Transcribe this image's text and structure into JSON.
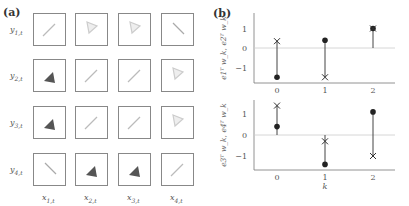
{
  "panel_a": {
    "label": "(a)",
    "row_labels": [
      "y1,t",
      "y2,t",
      "y3,t",
      "y4,t"
    ],
    "col_labels": [
      "x1,t",
      "x2,t",
      "x3,t",
      "x4,t"
    ],
    "grid": [
      [
        "line-ne-light",
        "triangle-outline-light",
        "triangle-outline-light",
        "line-nw-light"
      ],
      [
        "triangle-dark",
        "line-ne-light",
        "line-ne-light",
        "triangle-outline-light"
      ],
      [
        "triangle-dark",
        "line-ne-light",
        "line-ne-light",
        "triangle-outline-light"
      ],
      [
        "line-nw-light",
        "triangle-dark",
        "triangle-dark",
        "line-ne-light"
      ]
    ]
  },
  "panel_b": {
    "label": "(b)"
  },
  "chart_data": [
    {
      "type": "scatter",
      "subtype": "stem",
      "title": "",
      "xlabel": "",
      "ylabel": "e1ᵀ w_k, e2ᵀ w_k",
      "x": [
        0,
        1,
        2
      ],
      "xticks": [
        "0",
        "1",
        "2"
      ],
      "yticks": [
        "-1",
        "0",
        "1"
      ],
      "series": [
        {
          "name": "e1ᵀ w_k",
          "marker": "circle-filled",
          "values": [
            -1.5,
            0.4,
            1.0
          ]
        },
        {
          "name": "e2ᵀ w_k",
          "marker": "x",
          "values": [
            0.35,
            -1.5,
            1.0
          ]
        }
      ],
      "ylim": [
        -1.8,
        1.7
      ],
      "zero_line": true,
      "grid": false
    },
    {
      "type": "scatter",
      "subtype": "stem",
      "title": "",
      "xlabel": "k",
      "ylabel": "e3ᵀ w_k, e4ᵀ w_k",
      "x": [
        0,
        1,
        2
      ],
      "xticks": [
        "0",
        "1",
        "2"
      ],
      "yticks": [
        "-1",
        "0",
        "1"
      ],
      "series": [
        {
          "name": "e3ᵀ w_k",
          "marker": "circle-filled",
          "values": [
            0.4,
            -1.4,
            1.1
          ]
        },
        {
          "name": "e4ᵀ w_k",
          "marker": "x",
          "values": [
            1.4,
            -0.3,
            -1.0
          ]
        }
      ],
      "ylim": [
        -1.7,
        1.8
      ],
      "zero_line": true,
      "grid": false
    }
  ]
}
